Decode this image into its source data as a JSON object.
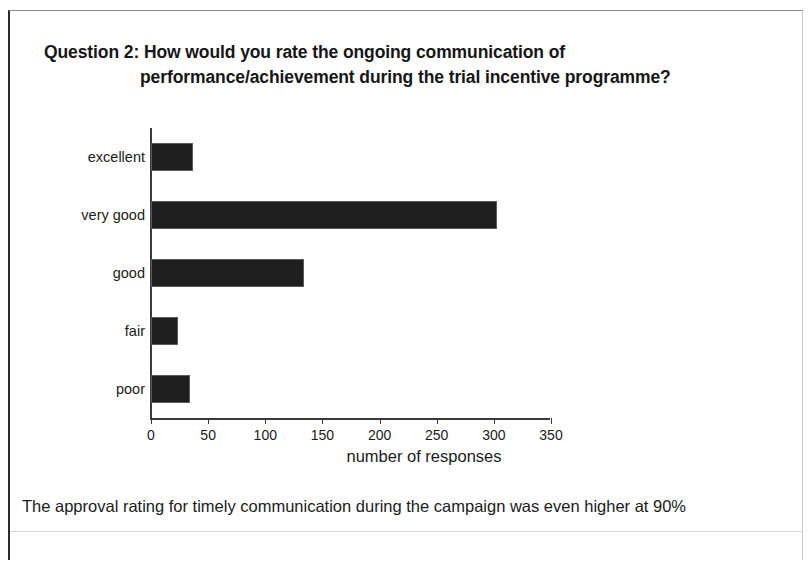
{
  "title": {
    "line1": "Question 2: How would you rate the ongoing communication of",
    "line2": "performance/achievement during the trial incentive programme?"
  },
  "footer_note": "The approval rating for timely communication during the campaign was even higher at 90%",
  "colors": {
    "bar": "#1f1f1f",
    "axis": "#3a3a3a",
    "text": "#1b1b1b",
    "frame": "#2b2b2b",
    "background": "#ffffff"
  },
  "chart_data": {
    "type": "bar",
    "orientation": "horizontal",
    "title": "Question 2: How would you rate the ongoing communication of performance/achievement during the trial incentive programme?",
    "categories": [
      "excellent",
      "very good",
      "good",
      "fair",
      "poor"
    ],
    "values": [
      37,
      303,
      134,
      24,
      34
    ],
    "series": [
      {
        "name": "number of responses",
        "values": [
          37,
          303,
          134,
          24,
          34
        ]
      }
    ],
    "xlabel": "number of responses",
    "ylabel": "",
    "xlim": [
      0,
      350
    ],
    "ylim": null,
    "xticks": [
      0,
      50,
      100,
      150,
      200,
      250,
      300,
      350
    ],
    "xtick_labels": [
      "0",
      "50",
      "100",
      "150",
      "200",
      "250",
      "300",
      "350"
    ],
    "grid": false,
    "legend": false,
    "legend_position": "none",
    "bar_color": "#1f1f1f"
  }
}
